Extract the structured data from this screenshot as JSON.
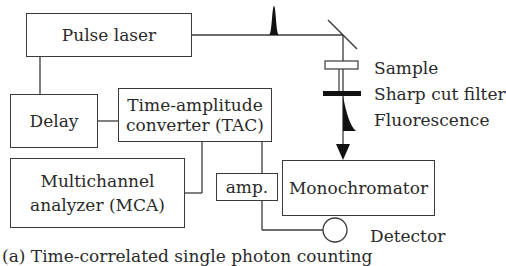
{
  "diagram": {
    "boxes": {
      "pulse_laser": "Pulse laser",
      "delay": "Delay",
      "tac_line1": "Time-amplitude",
      "tac_line2": "converter (TAC)",
      "mca_line1": "Multichannel",
      "mca_line2": "analyzer (MCA)",
      "amp": "amp.",
      "monochromator": "Monochromator"
    },
    "labels": {
      "sample": "Sample",
      "filter": "Sharp cut filter",
      "fluorescence": "Fluorescence",
      "detector": "Detector"
    },
    "caption": "(a) Time-correlated single photon counting"
  }
}
